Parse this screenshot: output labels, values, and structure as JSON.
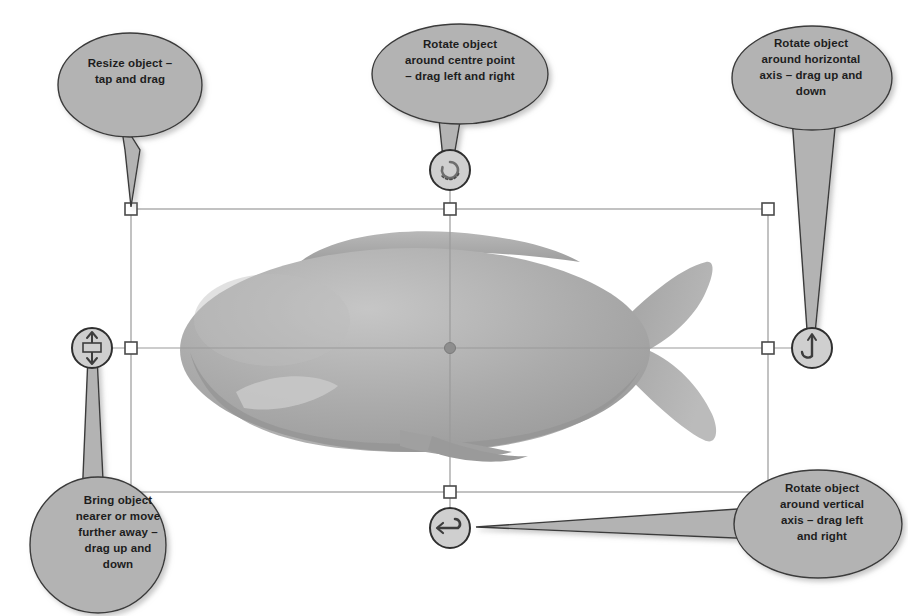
{
  "diagram": {
    "object_name": "fish-3d-model",
    "colors": {
      "callout_fill": "#b3b3b3",
      "callout_stroke": "#3a3a3a",
      "text": "#1d1d1d",
      "selection_line": "#9a9a9a",
      "handle_fill": "#ffffff",
      "handle_stroke": "#4a4a4a",
      "fish_body": "#a8a8a8",
      "fish_shadow": "#9b9b9b",
      "fish_light": "#c2c2c2",
      "page_background": "#ffffff"
    },
    "callouts": [
      {
        "id": "resize",
        "name": "callout-resize",
        "text": "Resize object –\ntap and drag",
        "target_handle": "corner-handle-top-left"
      },
      {
        "id": "rotate-centre",
        "name": "callout-rotate-centre",
        "text": "Rotate object\naround centre point\n– drag left and right",
        "target_handle": "rotate-centre-handle"
      },
      {
        "id": "rotate-horizontal",
        "name": "callout-rotate-horizontal-axis",
        "text": "Rotate object\naround horizontal\naxis – drag up and\ndown",
        "target_handle": "rotate-horizontal-handle"
      },
      {
        "id": "bring-nearer",
        "name": "callout-bring-nearer",
        "text": "Bring object\nnearer or move\nfurther away –\ndrag up and\ndown",
        "target_handle": "depth-handle"
      },
      {
        "id": "rotate-vertical",
        "name": "callout-rotate-vertical-axis",
        "text": "Rotate object\naround vertical\naxis – drag left\nand right",
        "target_handle": "rotate-vertical-handle"
      }
    ],
    "selection": {
      "box": {
        "left": 131,
        "top": 209,
        "right": 768,
        "bottom": 492
      },
      "handles": [
        {
          "name": "corner-handle-top-left",
          "x": 131,
          "y": 209,
          "shape": "square"
        },
        {
          "name": "edge-handle-top-center",
          "x": 450,
          "y": 209,
          "shape": "square"
        },
        {
          "name": "corner-handle-top-right",
          "x": 768,
          "y": 209,
          "shape": "square"
        },
        {
          "name": "edge-handle-left-center",
          "x": 131,
          "y": 348,
          "shape": "square"
        },
        {
          "name": "edge-handle-right-center",
          "x": 768,
          "y": 348,
          "shape": "square"
        },
        {
          "name": "edge-handle-bottom-center",
          "x": 450,
          "y": 492,
          "shape": "square"
        }
      ],
      "round_handles": [
        {
          "name": "rotate-centre-handle",
          "x": 450,
          "y": 170,
          "icon": "rotate-circular-icon"
        },
        {
          "name": "rotate-horizontal-handle",
          "x": 812,
          "y": 348,
          "icon": "rotate-vertical-arrow-icon"
        },
        {
          "name": "depth-handle",
          "x": 92,
          "y": 348,
          "icon": "depth-updown-icon"
        },
        {
          "name": "rotate-vertical-handle",
          "x": 450,
          "y": 528,
          "icon": "rotate-horizontal-arrow-icon"
        }
      ],
      "center_point": {
        "name": "object-center-point",
        "x": 450,
        "y": 348
      }
    }
  }
}
